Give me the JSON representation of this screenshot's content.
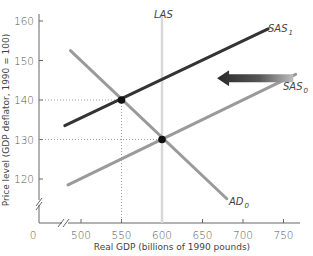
{
  "chart_data": {
    "type": "line",
    "title": "",
    "xlabel": "Real GDP (billions of 1990 pounds)",
    "ylabel": "Price level (GDP deflator, 1990 = 100)",
    "xlim": [
      475,
      770
    ],
    "ylim": [
      110,
      162
    ],
    "x_ticks": [
      500,
      550,
      600,
      650,
      700,
      750
    ],
    "y_ticks": [
      120,
      130,
      140,
      150,
      160
    ],
    "origin_label": "0",
    "axis_breaks": true,
    "grid": false,
    "series": [
      {
        "name": "LAS",
        "label": "LAS",
        "type": "vertical",
        "x": 600,
        "color": "#d8d8d8"
      },
      {
        "name": "SAS0",
        "label": "SAS",
        "subscript": "0",
        "points": [
          [
            484,
            118.5
          ],
          [
            765,
            146.5
          ]
        ],
        "color": "#9a9a9a"
      },
      {
        "name": "SAS1",
        "label": "SAS",
        "subscript": "1",
        "points": [
          [
            480,
            133.5
          ],
          [
            731,
            158
          ]
        ],
        "color": "#333333"
      },
      {
        "name": "AD0",
        "label": "AD",
        "subscript": "0",
        "points": [
          [
            487,
            152.5
          ],
          [
            680,
            115
          ]
        ],
        "color": "#9a9a9a"
      }
    ],
    "equilibria": [
      {
        "label": "initial",
        "x": 600,
        "y": 130
      },
      {
        "label": "new",
        "x": 550,
        "y": 140
      }
    ],
    "annotations": [
      {
        "type": "arrow",
        "direction": "left",
        "from": [
          762,
          145.5
        ],
        "to": [
          668,
          145.5
        ],
        "meaning": "SAS shifts left from SAS0 to SAS1"
      }
    ]
  },
  "labels": {
    "las": "LAS",
    "sas": "SAS",
    "ad": "AD",
    "sub0": "0",
    "sub1": "1"
  }
}
